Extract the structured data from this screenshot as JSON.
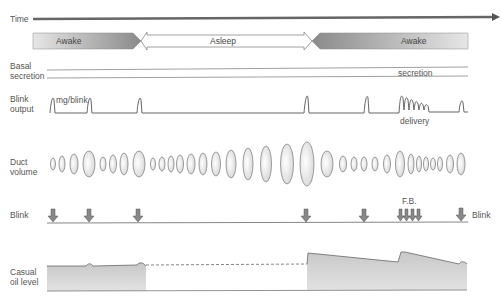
{
  "labels": {
    "time": "Time",
    "awake_left": "Awake",
    "asleep": "Asleep",
    "awake_right": "Awake",
    "basal_line1": "Basal",
    "basal_line2": "secretion",
    "basal_right": "secretion",
    "blink_output_line1": "Blink",
    "blink_output_line2": "output",
    "mg_per_blink": "mg/blink",
    "delivery": "delivery",
    "duct_line1": "Duct",
    "duct_line2": "volume",
    "blink_left": "Blink",
    "blink_right": "Blink",
    "fb": "F.B.",
    "casual_line1": "Casual",
    "casual_line2": "oil level"
  },
  "colors": {
    "text": "#555555",
    "line": "#666666",
    "arrow_dark": "#777777",
    "fill_gray": "#bbbbbb"
  },
  "rows": [
    {
      "name": "time",
      "desc": "Time axis arrow"
    },
    {
      "name": "states",
      "segments": [
        "Awake",
        "Asleep",
        "Awake"
      ]
    },
    {
      "name": "basal-secretion"
    },
    {
      "name": "blink-output",
      "peaks_x": [
        52,
        89,
        139,
        306,
        366,
        401,
        407,
        413,
        419,
        425,
        431,
        462
      ]
    },
    {
      "name": "duct-volume"
    },
    {
      "name": "blink-arrows",
      "arrows_x": [
        53,
        89,
        138,
        306,
        364,
        400,
        406,
        412,
        418,
        461
      ]
    },
    {
      "name": "casual-oil-level"
    }
  ]
}
